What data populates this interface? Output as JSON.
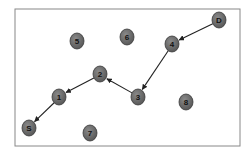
{
  "diagram": {
    "type": "directed-graph",
    "frame": {
      "x": 15,
      "y": 9,
      "width": 225,
      "height": 137,
      "stroke": "#888888"
    },
    "colors": {
      "node_fill": "#6f6f6f",
      "node_stroke": "#3a3a3a",
      "edge": "#222222",
      "label": "#111111"
    },
    "nodes": [
      {
        "id": "D",
        "label": "D",
        "x": 219,
        "y": 20
      },
      {
        "id": "4",
        "label": "4",
        "x": 172,
        "y": 44
      },
      {
        "id": "5a",
        "label": "5",
        "x": 77,
        "y": 41
      },
      {
        "id": "6",
        "label": "6",
        "x": 127,
        "y": 37
      },
      {
        "id": "2",
        "label": "2",
        "x": 100,
        "y": 74
      },
      {
        "id": "1",
        "label": "1",
        "x": 59,
        "y": 97
      },
      {
        "id": "3",
        "label": "3",
        "x": 138,
        "y": 97
      },
      {
        "id": "8",
        "label": "8",
        "x": 186,
        "y": 102
      },
      {
        "id": "S",
        "label": "S",
        "x": 29,
        "y": 128
      },
      {
        "id": "7",
        "label": "7",
        "x": 90,
        "y": 133
      }
    ],
    "edges": [
      {
        "from": "D",
        "to": "4"
      },
      {
        "from": "4",
        "to": "3"
      },
      {
        "from": "3",
        "to": "2"
      },
      {
        "from": "2",
        "to": "1"
      },
      {
        "from": "1",
        "to": "S"
      }
    ]
  }
}
